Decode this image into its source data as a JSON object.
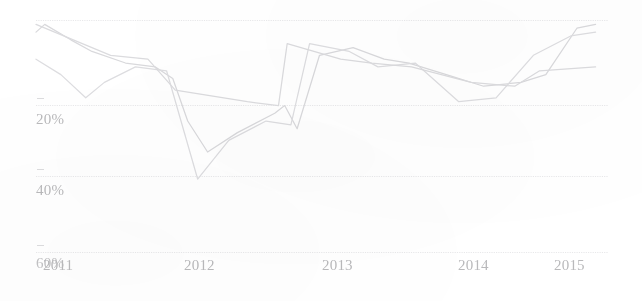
{
  "chart_data": {
    "type": "line",
    "title": "",
    "subtitle": "",
    "xlabel": "",
    "ylabel": "",
    "grid": true,
    "legend": "none",
    "x_tick_labels": [
      "2011",
      "2012",
      "2013",
      "2014",
      "2015"
    ],
    "y_tick_labels": [
      "0%",
      "20%",
      "40%",
      "60%"
    ],
    "y_tick_values": [
      0,
      20,
      40,
      60
    ],
    "ylim": [
      60,
      0
    ],
    "xlim": [
      "2011",
      "2015.6"
    ],
    "y_axis_inverted": true,
    "series": [
      {
        "name": "series-1",
        "color": "#d9d9dc",
        "points": [
          {
            "x": "2011.00",
            "y": 3
          },
          {
            "x": "2011.07",
            "y": 1
          },
          {
            "x": "2011.28",
            "y": 5
          },
          {
            "x": "2011.45",
            "y": 8
          },
          {
            "x": "2011.72",
            "y": 11
          },
          {
            "x": "2011.96",
            "y": 12
          },
          {
            "x": "2012.10",
            "y": 15
          },
          {
            "x": "2012.22",
            "y": 26
          },
          {
            "x": "2012.38",
            "y": 34
          },
          {
            "x": "2012.62",
            "y": 29
          },
          {
            "x": "2012.92",
            "y": 24
          },
          {
            "x": "2013.00",
            "y": 22
          },
          {
            "x": "2013.10",
            "y": 28
          },
          {
            "x": "2013.28",
            "y": 9
          },
          {
            "x": "2013.55",
            "y": 7
          },
          {
            "x": "2013.80",
            "y": 10
          },
          {
            "x": "2014.00",
            "y": 11
          },
          {
            "x": "2014.30",
            "y": 14
          },
          {
            "x": "2014.60",
            "y": 17
          },
          {
            "x": "2014.90",
            "y": 16
          },
          {
            "x": "2015.10",
            "y": 14
          },
          {
            "x": "2015.35",
            "y": 2
          },
          {
            "x": "2015.50",
            "y": 1
          }
        ]
      },
      {
        "name": "series-2",
        "color": "#dddde0",
        "points": [
          {
            "x": "2011.00",
            "y": 10
          },
          {
            "x": "2011.20",
            "y": 14
          },
          {
            "x": "2011.40",
            "y": 20
          },
          {
            "x": "2011.55",
            "y": 16
          },
          {
            "x": "2011.80",
            "y": 12
          },
          {
            "x": "2012.05",
            "y": 13
          },
          {
            "x": "2012.30",
            "y": 41
          },
          {
            "x": "2012.55",
            "y": 31
          },
          {
            "x": "2012.85",
            "y": 26
          },
          {
            "x": "2013.05",
            "y": 27
          },
          {
            "x": "2013.20",
            "y": 6
          },
          {
            "x": "2013.52",
            "y": 8
          },
          {
            "x": "2013.75",
            "y": 12
          },
          {
            "x": "2014.05",
            "y": 11
          },
          {
            "x": "2014.40",
            "y": 21
          },
          {
            "x": "2014.70",
            "y": 20
          },
          {
            "x": "2015.00",
            "y": 9
          },
          {
            "x": "2015.30",
            "y": 4
          },
          {
            "x": "2015.50",
            "y": 3
          }
        ]
      },
      {
        "name": "series-3",
        "color": "#dbdbde",
        "points": [
          {
            "x": "2011.00",
            "y": 1
          },
          {
            "x": "2011.60",
            "y": 9
          },
          {
            "x": "2011.90",
            "y": 10
          },
          {
            "x": "2012.12",
            "y": 18
          },
          {
            "x": "2012.70",
            "y": 21
          },
          {
            "x": "2012.95",
            "y": 22
          },
          {
            "x": "2013.02",
            "y": 6
          },
          {
            "x": "2013.45",
            "y": 10
          },
          {
            "x": "2013.70",
            "y": 11
          },
          {
            "x": "2014.02",
            "y": 12
          },
          {
            "x": "2014.50",
            "y": 16
          },
          {
            "x": "2014.85",
            "y": 17
          },
          {
            "x": "2015.05",
            "y": 13
          },
          {
            "x": "2015.50",
            "y": 12
          }
        ]
      }
    ]
  },
  "axis": {
    "y_labels": [
      {
        "text": "0%",
        "top": 256
      },
      {
        "text": "20%",
        "top": 112
      },
      {
        "text": "40%",
        "top": 183
      },
      {
        "text": "60%",
        "top": 256
      }
    ],
    "x_labels": [
      {
        "text": "2011",
        "left": 43
      },
      {
        "text": "2012",
        "left": 184
      },
      {
        "text": "2013",
        "left": 322
      },
      {
        "text": "2014",
        "left": 458
      },
      {
        "text": "2015",
        "left": 554
      }
    ]
  },
  "colors": {
    "background": "#ffffff",
    "gridline": "#e8e8ea",
    "tick_label": "#b9b9bb",
    "line": "#d9d9dc"
  }
}
